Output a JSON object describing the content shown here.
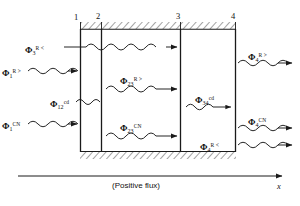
{
  "figure": {
    "axis_caption": "(Positive flux)",
    "axis_variable": "x",
    "line_color": "#1a1a1a",
    "background": "#ffffff"
  },
  "walls": [
    {
      "id": "wall-1",
      "label": "1"
    },
    {
      "id": "wall-2",
      "label": "2"
    },
    {
      "id": "wall-3",
      "label": "3"
    },
    {
      "id": "wall-4",
      "label": "4"
    }
  ],
  "fluxes": [
    {
      "id": "phi-3-R-less",
      "symbol": "Φ",
      "subscript": "3",
      "superscript": "R <",
      "region": "outside-left-upper",
      "direction": "right"
    },
    {
      "id": "phi-1-R-greater",
      "symbol": "Φ",
      "subscript": "1",
      "superscript": "R >",
      "region": "outside-left",
      "direction": "right"
    },
    {
      "id": "phi-12-cd",
      "symbol": "Φ",
      "subscript": "12",
      "superscript": "cd",
      "region": "between-1-and-2",
      "direction": "right"
    },
    {
      "id": "phi-1-CN",
      "symbol": "Φ",
      "subscript": "1",
      "superscript": "CN",
      "region": "outside-left-lower",
      "direction": "right"
    },
    {
      "id": "phi-23-R-greater",
      "symbol": "Φ",
      "subscript": "23",
      "superscript": "R >",
      "region": "between-2-and-3",
      "direction": "right"
    },
    {
      "id": "phi-23-CN",
      "symbol": "Φ",
      "subscript": "23",
      "superscript": "CN",
      "region": "between-2-and-3",
      "direction": "right"
    },
    {
      "id": "phi-34-cd",
      "symbol": "Φ",
      "subscript": "34",
      "superscript": "cd",
      "region": "between-3-and-4",
      "direction": "right"
    },
    {
      "id": "phi-4-R-less",
      "symbol": "Φ",
      "subscript": "4",
      "superscript": "R <",
      "region": "between-3-and-4-lower",
      "direction": "right"
    },
    {
      "id": "phi-4-R-greater",
      "symbol": "Φ",
      "subscript": "4",
      "superscript": "R >",
      "region": "outside-right-upper",
      "direction": "right"
    },
    {
      "id": "phi-4-CN",
      "symbol": "Φ",
      "subscript": "4",
      "superscript": "CN",
      "region": "outside-right-lower",
      "direction": "right"
    }
  ]
}
